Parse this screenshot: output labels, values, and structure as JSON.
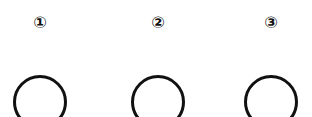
{
  "steps": [
    {
      "number_label": "①"
    },
    {
      "number_label": "②"
    },
    {
      "number_label": "③"
    }
  ]
}
